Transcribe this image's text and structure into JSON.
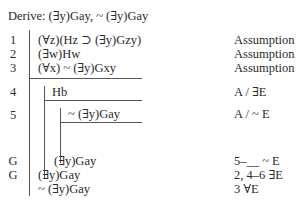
{
  "header": {
    "title": "Derive: (∃y)Gay, ~ (∃y)Gay"
  },
  "lines": [
    {
      "num": "1",
      "formula": "(∀z)(Hz ⊃ (∃y)Gzy)",
      "justification": "Assumption"
    },
    {
      "num": "2",
      "formula": "(∃w)Hw",
      "justification": "Assumption"
    },
    {
      "num": "3",
      "formula": "(∀x) ~ (∃y)Gxy",
      "justification": "Assumption"
    },
    {
      "num": "4",
      "formula": "Hb",
      "justification": "A / ∃E"
    },
    {
      "num": "5",
      "formula": "~ (∃y)Gay",
      "justification": "A / ~ E"
    },
    {
      "num": "G",
      "formula": "(∃y)Gay",
      "justification": "5–__ ~ E"
    },
    {
      "num": "G",
      "formula": "(∃y)Gay",
      "justification": "2, 4–6 ∃E"
    },
    {
      "num": "",
      "formula": "~ (∃y)Gay",
      "justification": "3 ∀E"
    }
  ]
}
